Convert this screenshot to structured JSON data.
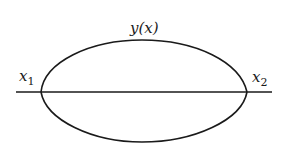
{
  "diagram": {
    "type": "variational-curves",
    "labels": {
      "curve": "y(x)",
      "left_point_base": "x",
      "left_point_sub": "1",
      "right_point_base": "x",
      "right_point_sub": "2"
    },
    "colors": {
      "stroke": "#1a1a1a",
      "background": "#ffffff"
    },
    "geometry": {
      "axis": {
        "x1": 16,
        "x2": 272,
        "y": 92
      },
      "left_vertex": {
        "x": 41,
        "y": 92
      },
      "right_vertex": {
        "x": 247,
        "y": 92
      },
      "upper_curve_apex": {
        "x": 142,
        "y": 40
      },
      "lower_curve_bottom": {
        "x": 142,
        "y": 142
      }
    }
  }
}
